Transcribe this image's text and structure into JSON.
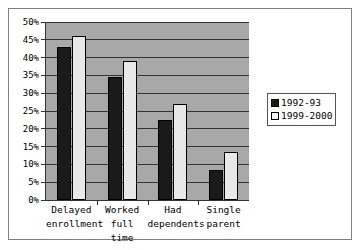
{
  "chart_data": {
    "type": "bar",
    "title": "",
    "xlabel": "",
    "ylabel": "",
    "categories": [
      "Delayed\nenrollment",
      "Worked\nfull\ntime",
      "Had\ndependents",
      "Single\nparent"
    ],
    "series": [
      {
        "name": "1992-93",
        "color": "#1a1a1a",
        "values": [
          43,
          34.5,
          22.5,
          8.5
        ]
      },
      {
        "name": "1999-2000",
        "color": "#e8e8e8",
        "values": [
          46,
          39,
          27,
          13.5
        ]
      }
    ],
    "ylim": [
      0,
      50
    ],
    "ytick_labels": [
      "0%",
      "5%",
      "10%",
      "15%",
      "20%",
      "25%",
      "30%",
      "35%",
      "40%",
      "45%",
      "50%"
    ],
    "ytick_values": [
      0,
      5,
      10,
      15,
      20,
      25,
      30,
      35,
      40,
      45,
      50
    ],
    "grid": true,
    "legend_position": "right",
    "plot_background": "#a8a8a8",
    "figure_background": "#ffffff",
    "axis_color": "#333333"
  },
  "legend": {
    "entries": [
      {
        "label": "1992-93"
      },
      {
        "label": "1999-2000"
      }
    ]
  }
}
